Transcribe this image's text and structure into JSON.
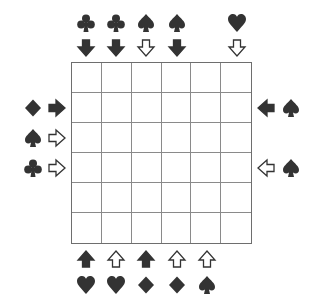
{
  "puzzle": {
    "rows": 6,
    "cols": 6,
    "colors": {
      "ink": "#333333",
      "grid": "#7a7a7a",
      "background": "#ffffff"
    },
    "top_clues": [
      {
        "col": 1,
        "suit": "club",
        "arrow": "down",
        "filled": true
      },
      {
        "col": 2,
        "suit": "club",
        "arrow": "down",
        "filled": true
      },
      {
        "col": 3,
        "suit": "spade",
        "arrow": "down",
        "filled": false
      },
      {
        "col": 4,
        "suit": "spade",
        "arrow": "down",
        "filled": true
      },
      {
        "col": 6,
        "suit": "heart",
        "arrow": "down",
        "filled": false
      }
    ],
    "bottom_clues": [
      {
        "col": 1,
        "suit": "heart",
        "arrow": "up",
        "filled": true
      },
      {
        "col": 2,
        "suit": "heart",
        "arrow": "up",
        "filled": false
      },
      {
        "col": 3,
        "suit": "diamond",
        "arrow": "up",
        "filled": true
      },
      {
        "col": 4,
        "suit": "diamond",
        "arrow": "up",
        "filled": false
      },
      {
        "col": 5,
        "suit": "spade",
        "arrow": "up",
        "filled": false
      }
    ],
    "left_clues": [
      {
        "row": 2,
        "suit": "diamond",
        "arrow": "right",
        "filled": true
      },
      {
        "row": 3,
        "suit": "spade",
        "arrow": "right",
        "filled": false
      },
      {
        "row": 4,
        "suit": "club",
        "arrow": "right",
        "filled": false
      }
    ],
    "right_clues": [
      {
        "row": 2,
        "suit": "spade",
        "arrow": "left",
        "filled": true
      },
      {
        "row": 4,
        "suit": "spade",
        "arrow": "left",
        "filled": false
      }
    ]
  }
}
